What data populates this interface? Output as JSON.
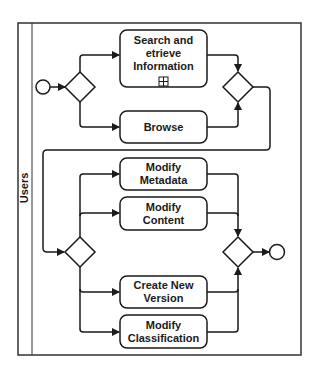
{
  "diagram": {
    "type": "BPMN process",
    "pool": {
      "lane_label": "Users"
    },
    "events": {
      "start": {
        "shape": "circle"
      },
      "end": {
        "shape": "circle"
      }
    },
    "gateways": [
      {
        "id": "split-1",
        "shape": "diamond"
      },
      {
        "id": "merge-1",
        "shape": "diamond"
      },
      {
        "id": "split-2",
        "shape": "diamond"
      },
      {
        "id": "merge-2",
        "shape": "diamond"
      }
    ],
    "tasks": [
      {
        "id": "search",
        "label": "Search and\netrieve\nInformation",
        "subprocess_marker": "boxed-plus-icon"
      },
      {
        "id": "browse",
        "label": "Browse"
      },
      {
        "id": "modify-metadata",
        "label": "Modify\nMetadata"
      },
      {
        "id": "modify-content",
        "label": "Modify\nContent"
      },
      {
        "id": "create-version",
        "label": "Create New\nVersion"
      },
      {
        "id": "modify-classification",
        "label": "Modify\nClassification"
      }
    ],
    "colors": {
      "stroke": "#1a1a1a",
      "fill": "#ffffff"
    }
  }
}
